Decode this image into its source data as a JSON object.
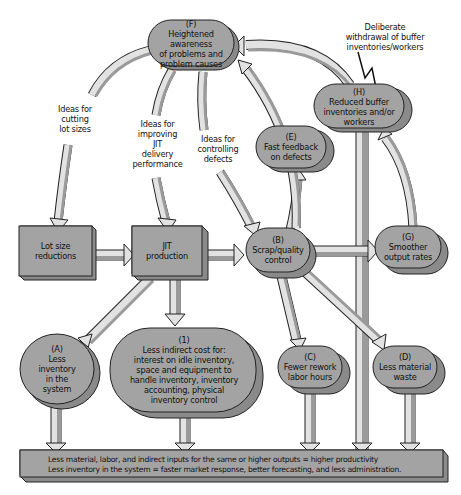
{
  "nodes": {
    "F": {
      "id": "(F)",
      "text": "Heightened awareness of problems and problem causes",
      "lines": [
        "(F)",
        "Heightened awareness",
        "of problems and",
        "problem causes"
      ]
    },
    "H": {
      "id": "(H)",
      "lines": [
        "(H)",
        "Reduced buffer",
        "inventories and/or",
        "workers"
      ]
    },
    "E": {
      "id": "(E)",
      "lines": [
        "(E)",
        "Fast feedback",
        "on defects"
      ]
    },
    "lot": {
      "lines": [
        "Lot size",
        "reductions"
      ]
    },
    "jit": {
      "lines": [
        "JIT",
        "production"
      ]
    },
    "B": {
      "id": "(B)",
      "lines": [
        "(B)",
        "Scrap/quality",
        "control"
      ]
    },
    "G": {
      "id": "(G)",
      "lines": [
        "(G)",
        "Smoother",
        "output rates"
      ]
    },
    "A": {
      "id": "(A)",
      "lines": [
        "(A)",
        "Less",
        "inventory",
        "in the",
        "system"
      ]
    },
    "one": {
      "id": "(1)",
      "lines": [
        "(1)",
        "Less indirect cost for:",
        "interest on idle inventory,",
        "space and equipment to",
        "handle inventory, inventory",
        "accounting, physical",
        "inventory control"
      ]
    },
    "C": {
      "id": "(C)",
      "lines": [
        "(C)",
        "Fewer rework",
        "labor hours"
      ]
    },
    "D": {
      "id": "(D)",
      "lines": [
        "(D)",
        "Less material",
        "waste"
      ]
    }
  },
  "labels": {
    "cutting": [
      "Ideas for",
      "cutting",
      "lot sizes"
    ],
    "improving": [
      "Ideas for",
      "improving",
      "JIT",
      "delivery",
      "performance"
    ],
    "controlling": [
      "Ideas for",
      "controlling",
      "defects"
    ],
    "withdrawal": [
      "Deliberate",
      "withdrawal of buffer",
      "inventories/workers"
    ]
  },
  "outcome_bar": {
    "line1": "Less material, labor, and indirect inputs for the same or higher outputs = higher productivity",
    "line2": "Less inventory in the system = faster market response, better forecasting, and less administration."
  },
  "colors": {
    "node_fill": "#a3a3a3",
    "node_shadow": "#8a8a8a",
    "arrow_light": "#e2e2e2",
    "arrow_dark": "#9a9a9a",
    "outline": "#222222"
  }
}
